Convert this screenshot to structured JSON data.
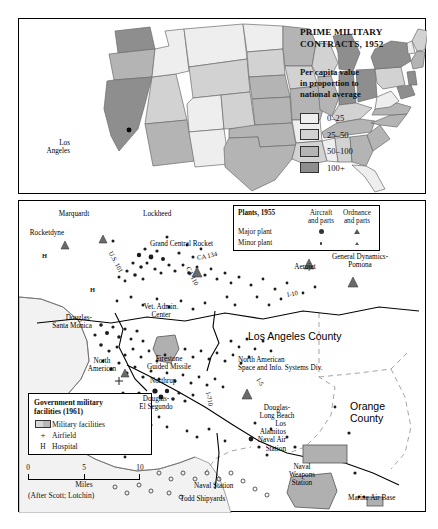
{
  "figure": {
    "us_map": {
      "title": "PRIME MILITARY\nCONTRACTS, 1952",
      "subtitle": "Per capita value\nin proportion to\nnational average",
      "city_label": "Los\nAngeles",
      "legend": [
        {
          "label": "0–25",
          "color": "#eeeeee"
        },
        {
          "label": "25–50",
          "color": "#d2d2d2"
        },
        {
          "label": "50–100",
          "color": "#b4b4b4"
        },
        {
          "label": "100+",
          "color": "#8e8e8e"
        }
      ]
    },
    "la_map": {
      "plants_legend": {
        "title": "Plants, 1955",
        "col1": "Aircraft\nand parts",
        "col2": "Ordnance\nand parts",
        "rows": [
          "Major plant",
          "Minor plant"
        ]
      },
      "gov_legend": {
        "title": "Government military\nfacilities (1961)",
        "rows": [
          {
            "label": "Military facilities",
            "symbol": "swatch"
          },
          {
            "label": "Airfield",
            "symbol": "+"
          },
          {
            "label": "Hospital",
            "symbol": "H"
          }
        ]
      },
      "scale": {
        "ticks": [
          "0",
          "5",
          "10"
        ],
        "units": "Miles",
        "source": "(After Scott; Lotchin)"
      },
      "counties": [
        "Los Angeles County",
        "Orange County"
      ],
      "highways": [
        "U.S. 101",
        "CA 134",
        "CA 110",
        "I-10",
        "I-5",
        "I-710"
      ],
      "plant_labels": [
        "Marquardt",
        "Rocketdyne",
        "Lockheed",
        "Grand Central Rocket",
        "Aerojet",
        "General Dynamics-\nPomona",
        "Vet. Admin.\nCenter",
        "Douglas-\nSanta Monica",
        "North\nAmerican",
        "Firestone\nGuided Missile",
        "Northrup",
        "Douglas-\nEl Segundo",
        "North American\nSpace and Info. Systems Div.",
        "Douglas-\nLong Beach",
        "Los\nAlamitos\nNaval Air\nStation",
        "Naval\nWeapons\nStation",
        "Naval Station",
        "Todd Shipyards",
        "Marine Air Base"
      ]
    }
  }
}
